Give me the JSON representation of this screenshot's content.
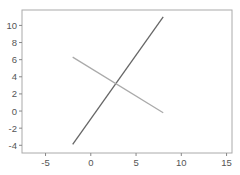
{
  "chart_data": {
    "type": "line",
    "title": "",
    "xlabel": "",
    "ylabel": "",
    "xlim": [
      -7.6,
      15.6
    ],
    "ylim": [
      -4.9,
      11.8
    ],
    "grid": false,
    "legend": null,
    "x_ticks": [
      -5,
      0,
      5,
      10,
      15
    ],
    "y_ticks": [
      -4,
      -2,
      0,
      2,
      4,
      6,
      8,
      10
    ],
    "series": [
      {
        "name": "line-1",
        "color": "#666666",
        "x": [
          -2,
          8
        ],
        "y": [
          -3.9,
          11
        ]
      },
      {
        "name": "line-2",
        "color": "#aaaaaa",
        "x": [
          -2,
          8
        ],
        "y": [
          6.3,
          -0.2
        ]
      }
    ]
  },
  "colors": {
    "axis": "#888888",
    "frame": "#999999",
    "tick_text": "#555555",
    "background": "#ffffff"
  }
}
